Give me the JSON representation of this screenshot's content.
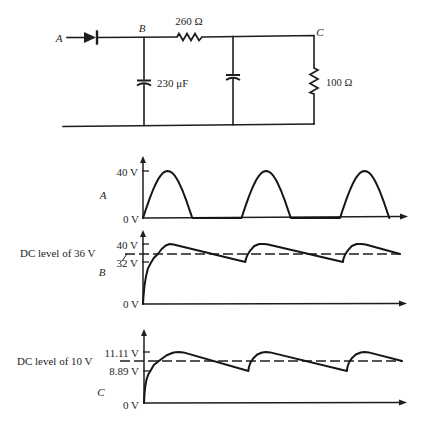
{
  "circuit": {
    "node_labels": {
      "a": "A",
      "b": "B",
      "c": "C"
    },
    "diode": {
      "label": ""
    },
    "series_resistor": {
      "label": "260 Ω",
      "value_ohm": 260
    },
    "input_capacitor": {
      "label": "230 μF",
      "value_uF": 230
    },
    "filter_capacitor": {
      "label": ""
    },
    "load_resistor": {
      "label": "100 Ω",
      "value_ohm": 100
    }
  },
  "chart_data": [
    {
      "type": "line",
      "title": "",
      "xlabel": "",
      "ylabel": "A",
      "x_unit": "period",
      "x_range": [
        0,
        2.7
      ],
      "ylim": [
        0,
        40
      ],
      "grid": false,
      "legend": "none",
      "y_ticks": [
        {
          "value": 0,
          "label": "0 V"
        },
        {
          "value": 40,
          "label": "40 V"
        }
      ],
      "series": [
        {
          "name": "A",
          "waveform": "half-wave rectified sine",
          "peak": 40,
          "pulses": [
            [
              0,
              0.5
            ],
            [
              1,
              1.5
            ],
            [
              2,
              2.5
            ]
          ]
        }
      ]
    },
    {
      "type": "line",
      "title": "",
      "xlabel": "",
      "ylabel": "B",
      "x_unit": "period",
      "x_range": [
        0,
        2.7
      ],
      "ylim": [
        0,
        40
      ],
      "grid": false,
      "legend": "none",
      "y_ticks": [
        {
          "value": 0,
          "label": "0 V"
        },
        {
          "value": 32,
          "label": "32 V"
        },
        {
          "value": 40,
          "label": "40 V"
        }
      ],
      "annotations": [
        {
          "text": "DC level of 36 V",
          "value": 36,
          "style": "dashed"
        }
      ],
      "series": [
        {
          "name": "B",
          "ripple_min": 32,
          "ripple_max": 40,
          "points": [
            [
              0,
              0
            ],
            [
              0.005,
              6
            ],
            [
              0.015,
              14
            ],
            [
              0.03,
              21
            ],
            [
              0.05,
              27
            ],
            [
              0.08,
              31.5
            ],
            [
              0.11,
              34
            ],
            [
              0.15,
              36
            ],
            [
              0.19,
              38
            ],
            [
              0.23,
              39.4
            ],
            [
              0.27,
              40
            ],
            [
              0.31,
              39.8
            ],
            [
              1.04,
              32
            ],
            [
              1.045,
              33.5
            ],
            [
              1.06,
              35.5
            ],
            [
              1.09,
              37.5
            ],
            [
              1.13,
              39.2
            ],
            [
              1.18,
              40
            ],
            [
              1.23,
              40
            ],
            [
              1.27,
              39.8
            ],
            [
              2.03,
              32
            ],
            [
              2.035,
              33.5
            ],
            [
              2.05,
              35.5
            ],
            [
              2.08,
              37.5
            ],
            [
              2.12,
              39.2
            ],
            [
              2.17,
              40
            ],
            [
              2.22,
              40
            ],
            [
              2.26,
              39.8
            ],
            [
              2.61,
              36
            ]
          ]
        }
      ]
    },
    {
      "type": "line",
      "title": "",
      "xlabel": "",
      "ylabel": "C",
      "x_unit": "period",
      "x_range": [
        0,
        2.7
      ],
      "ylim": [
        0,
        11.11
      ],
      "grid": false,
      "legend": "none",
      "y_ticks": [
        {
          "value": 0,
          "label": "0 V"
        },
        {
          "value": 8.89,
          "label": "8.89 V"
        },
        {
          "value": 11.11,
          "label": "11.11 V"
        }
      ],
      "annotations": [
        {
          "text": "DC level of 10 V",
          "value": 10,
          "style": "dashed"
        }
      ],
      "series": [
        {
          "name": "C",
          "ripple_min": 8.89,
          "ripple_max": 11.11,
          "points": [
            [
              0,
              0
            ],
            [
              0.005,
              2.5
            ],
            [
              0.012,
              4.5
            ],
            [
              0.025,
              6.5
            ],
            [
              0.045,
              8
            ],
            [
              0.065,
              8.89
            ],
            [
              0.1,
              9.55
            ],
            [
              0.16,
              10.1
            ],
            [
              0.23,
              10.7
            ],
            [
              0.3,
              11.05
            ],
            [
              0.35,
              11.11
            ],
            [
              0.4,
              11.06
            ],
            [
              1.06,
              8.89
            ],
            [
              1.065,
              9.3
            ],
            [
              1.08,
              9.8
            ],
            [
              1.11,
              10.35
            ],
            [
              1.15,
              10.8
            ],
            [
              1.2,
              11.05
            ],
            [
              1.24,
              11.11
            ],
            [
              1.28,
              11.06
            ],
            [
              2.06,
              8.89
            ],
            [
              2.065,
              9.3
            ],
            [
              2.08,
              9.8
            ],
            [
              2.11,
              10.35
            ],
            [
              2.15,
              10.8
            ],
            [
              2.2,
              11.05
            ],
            [
              2.24,
              11.11
            ],
            [
              2.28,
              11.06
            ],
            [
              2.62,
              10
            ]
          ]
        }
      ]
    }
  ]
}
